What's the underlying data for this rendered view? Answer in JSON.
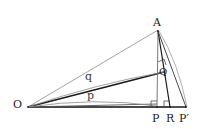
{
  "figure": {
    "type": "geometry-diagram",
    "canvas": {
      "width": 203,
      "height": 129,
      "background": "#ffffff"
    },
    "colors": {
      "stroke_dark": "#1a1a1a",
      "stroke_mid": "#555555",
      "stroke_light": "#8a8a8a",
      "label": "#1a1a1a",
      "label_soft": "#3a3a3a"
    },
    "points": [
      {
        "name": "A",
        "label": "A",
        "x": 158,
        "y": 30
      },
      {
        "name": "O",
        "label": "O",
        "x": 28,
        "y": 107
      },
      {
        "name": "P",
        "label": "P",
        "x": 157,
        "y": 107
      },
      {
        "name": "R",
        "label": "R",
        "x": 170,
        "y": 107
      },
      {
        "name": "Pp",
        "label": "P′",
        "x": 186,
        "y": 107
      },
      {
        "name": "Q",
        "label": "Q",
        "x": 163,
        "y": 72
      }
    ],
    "segment_labels": [
      {
        "name": "q",
        "label": "q",
        "x": 88,
        "y": 77
      },
      {
        "name": "p",
        "label": "p",
        "x": 90,
        "y": 96
      }
    ],
    "segments": [
      {
        "name": "O-A",
        "from": "O",
        "to": "A",
        "weight": "light"
      },
      {
        "name": "O-Q",
        "from": "O",
        "to": "Q",
        "weight": "dark"
      },
      {
        "name": "O-P",
        "from": "O",
        "to": "P",
        "weight": "dark"
      },
      {
        "name": "O-Pp",
        "from": "O",
        "to": "Pp",
        "weight": "dark"
      },
      {
        "name": "O-R",
        "from": "O",
        "to": "R",
        "weight": "light"
      },
      {
        "name": "A-P",
        "from": "A",
        "to": "P",
        "weight": "mid"
      },
      {
        "name": "A-R",
        "from": "A",
        "to": "R",
        "weight": "dark"
      },
      {
        "name": "A-Pp",
        "from": "A",
        "to": "Pp",
        "weight": "mid"
      }
    ],
    "arcs": [
      {
        "name": "arc-q",
        "from": "O",
        "to": "Q",
        "label": "q"
      },
      {
        "name": "arc-p",
        "from": "O",
        "to": "P",
        "label": "p"
      },
      {
        "name": "arc-A",
        "from": "A",
        "to": "Pp",
        "label": ""
      }
    ],
    "right_angles": [
      {
        "name": "right-angle-at-P",
        "at": "P"
      },
      {
        "name": "right-angle-at-R",
        "at": "R"
      },
      {
        "name": "right-angle-at-Q",
        "at": "Q"
      }
    ]
  }
}
